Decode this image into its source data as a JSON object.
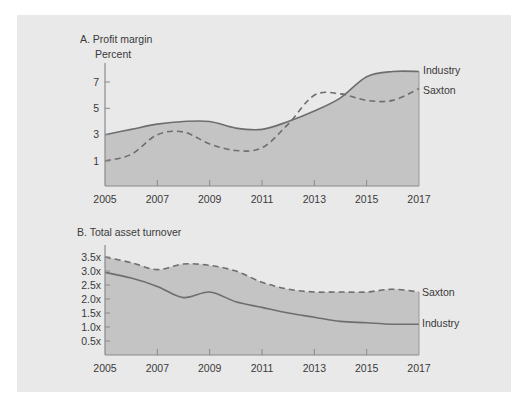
{
  "colors": {
    "panel_bg": "#e9e9e9",
    "area_fill": "#c4c4c4",
    "line": "#6e6e6e",
    "axis": "#8a8a8a",
    "text": "#3a3a3a"
  },
  "chart_data": [
    {
      "type": "area",
      "title": "A. Profit margin",
      "ylabel": "Percent",
      "xlabel": "",
      "x_ticks": [
        "2005",
        "2007",
        "2009",
        "2011",
        "2013",
        "2015",
        "2017"
      ],
      "y_ticks": [
        "1",
        "3",
        "5",
        "7"
      ],
      "ylim": [
        0,
        9
      ],
      "grid": false,
      "legend_position": "inline-right",
      "x": [
        2005,
        2006,
        2007,
        2008,
        2009,
        2010,
        2011,
        2012,
        2013,
        2014,
        2015,
        2016,
        2017
      ],
      "series": [
        {
          "name": "Industry",
          "style": "solid",
          "filled": true,
          "values": [
            3.0,
            3.4,
            3.8,
            4.0,
            4.0,
            3.5,
            3.4,
            4.0,
            4.8,
            5.8,
            7.4,
            7.8,
            7.8
          ]
        },
        {
          "name": "Saxton",
          "style": "dashed",
          "filled": false,
          "values": [
            1.0,
            1.5,
            3.0,
            3.2,
            2.3,
            1.8,
            2.0,
            3.8,
            6.0,
            6.1,
            5.6,
            5.6,
            6.5
          ]
        }
      ]
    },
    {
      "type": "area",
      "title": "B. Total asset turnover",
      "ylabel": "",
      "xlabel": "",
      "x_ticks": [
        "2005",
        "2007",
        "2009",
        "2011",
        "2013",
        "2015",
        "2017"
      ],
      "y_ticks": [
        "0.5x",
        "1.0x",
        "1.5x",
        "2.0x",
        "2.5x",
        "3.0x",
        "3.5x"
      ],
      "ylim": [
        0,
        3.8
      ],
      "grid": false,
      "legend_position": "inline-right",
      "x": [
        2005,
        2006,
        2007,
        2008,
        2009,
        2010,
        2011,
        2012,
        2013,
        2014,
        2015,
        2016,
        2017
      ],
      "series": [
        {
          "name": "Saxton",
          "style": "dashed",
          "filled": true,
          "values": [
            3.5,
            3.3,
            3.05,
            3.25,
            3.2,
            3.0,
            2.6,
            2.35,
            2.25,
            2.25,
            2.25,
            2.35,
            2.25
          ]
        },
        {
          "name": "Industry",
          "style": "solid",
          "filled": false,
          "values": [
            2.95,
            2.75,
            2.45,
            2.05,
            2.25,
            1.9,
            1.7,
            1.5,
            1.35,
            1.2,
            1.15,
            1.1,
            1.1
          ]
        }
      ]
    }
  ],
  "labels": {
    "a_title": "A. Profit margin",
    "a_ylabel": "Percent",
    "a_industry": "Industry",
    "a_saxton": "Saxton",
    "b_title": "B. Total asset turnover",
    "b_saxton": "Saxton",
    "b_industry": "Industry"
  }
}
